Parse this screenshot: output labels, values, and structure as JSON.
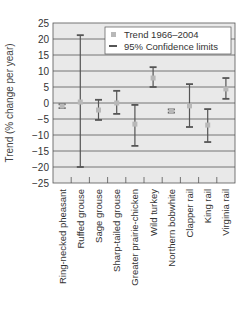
{
  "chart_data": {
    "type": "scatter",
    "title": "",
    "xlabel": "",
    "ylabel": "Trend (% change per year)",
    "ylim": [
      -25,
      25
    ],
    "yticks": [
      25,
      20,
      15,
      10,
      5,
      0,
      -5,
      -10,
      -15,
      -20,
      -25
    ],
    "ytick_labels": [
      "25",
      "20",
      "15",
      "10",
      "5",
      "0",
      "−5",
      "−10",
      "−15",
      "−20",
      "−25"
    ],
    "grid": true,
    "legend_position": "upper right",
    "categories": [
      "Ring-necked pheasant",
      "Ruffed grouse",
      "Sage grouse",
      "Sharp-tailed grouse",
      "Greater prairie-chicken",
      "Wild turkey",
      "Northern bobwhite",
      "Clapper rail",
      "King rail",
      "Virginia rail"
    ],
    "series": [
      {
        "name": "Trend 1966–2004",
        "values": [
          -1.0,
          0.3,
          -2.2,
          0.0,
          -6.6,
          7.8,
          -2.5,
          -0.9,
          -6.9,
          4.4
        ]
      },
      {
        "name": "95% Confidence limits",
        "lower": [
          -1.6,
          -20.0,
          -5.3,
          -3.4,
          -13.4,
          5.0,
          -3.0,
          -7.5,
          -12.2,
          1.3
        ],
        "upper": [
          -0.4,
          21.2,
          1.0,
          3.8,
          -0.6,
          11.2,
          -2.0,
          5.9,
          -1.9,
          7.8
        ]
      }
    ]
  },
  "legend": {
    "items": [
      {
        "label": "Trend 1966–2004",
        "symbol": "square-marker"
      },
      {
        "label": "95% Confidence limits",
        "symbol": "dash-marker"
      }
    ]
  },
  "colors": {
    "plot_background": "#e9e9e9",
    "gridline": "#555555",
    "errorbar": "#555555",
    "marker": "#b8b8b8",
    "legend_background": "#ffffff"
  }
}
